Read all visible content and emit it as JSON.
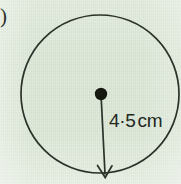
{
  "page": {
    "kind": "textbook-figure-scan",
    "width": 181,
    "height": 184,
    "background_color": "#dbe7d6",
    "ink_color": "#2b322a"
  },
  "item_marker": {
    "text": ")",
    "note": "trailing bracket of a cropped question label"
  },
  "figure": {
    "name": "circle-with-radius",
    "stroke_color": "#2b322a",
    "circle": {
      "center_x": 100,
      "center_y": 94,
      "radius": 79,
      "stroke_width": 1.7
    },
    "center_dot": {
      "center_x": 101,
      "center_y": 94,
      "radius": 6.2,
      "fill": "#16190f"
    },
    "radius_arrow": {
      "from_x": 101,
      "from_y": 94,
      "to_x": 105,
      "to_y": 177,
      "stroke_width": 1.7,
      "arrowhead": "open-v-down"
    }
  },
  "labels": {
    "radius_value": "4·5",
    "radius_unit": "cm",
    "radius_full": "4·5 cm"
  },
  "measurement": {
    "quantity": "radius",
    "value": 4.5,
    "unit": "cm",
    "decimal_separator": "middle-dot"
  }
}
